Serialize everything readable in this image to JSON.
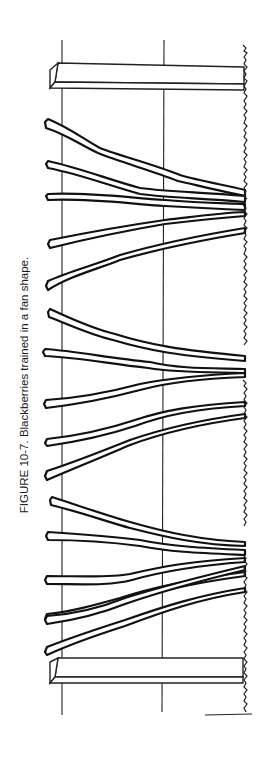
{
  "figure": {
    "caption": "FIGURE 10-7. Blackberries trained in a fan shape.",
    "elements": {
      "wires": 2,
      "posts": 2,
      "plants": 3,
      "canes_per_plant": [
        6,
        5,
        6
      ]
    }
  }
}
